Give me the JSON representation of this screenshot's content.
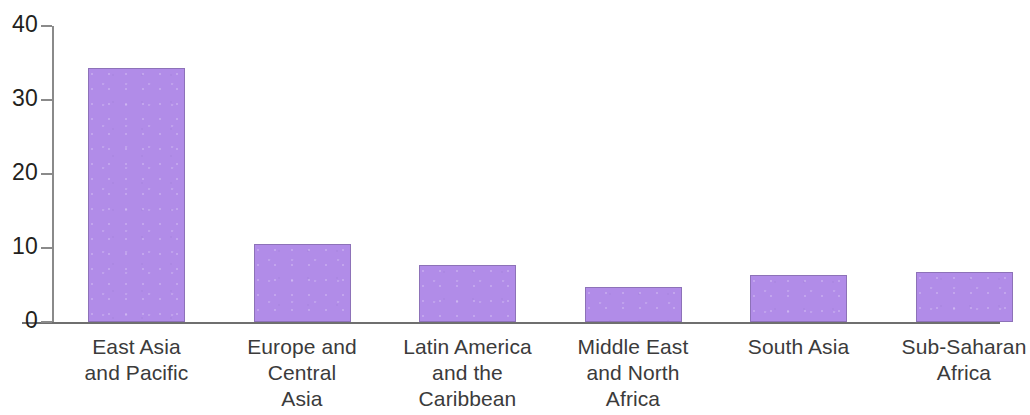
{
  "chart_data": {
    "type": "bar",
    "title": "",
    "subtitle": "",
    "xlabel": "",
    "ylabel": "",
    "categories": [
      "East Asia and Pacific",
      "Europe and Central Asia",
      "Latin America and the Caribbean",
      "Middle East and North Africa",
      "South Asia",
      "Sub-Saharan Africa"
    ],
    "category_lines": [
      [
        "East Asia",
        "and Pacific"
      ],
      [
        "Europe and",
        "Central",
        "Asia"
      ],
      [
        "Latin America",
        "and the",
        "Caribbean"
      ],
      [
        "Middle East",
        "and North",
        "Africa"
      ],
      [
        "South Asia"
      ],
      [
        "Sub-Saharan",
        "Africa"
      ]
    ],
    "values": [
      34.3,
      10.5,
      7.7,
      4.7,
      6.3,
      6.7
    ],
    "ylim": [
      0,
      40
    ],
    "yticks": [
      0,
      10,
      20,
      30,
      40
    ],
    "ytick_labels": [
      "0",
      "10",
      "20",
      "30",
      "40"
    ],
    "grid": false,
    "legend": null,
    "bar_color": "#b18ce8",
    "bar_border_color": "#8d72b8",
    "axis_color": "#6f6f6f",
    "label_color": "#3b3b3b",
    "background": "#ffffff"
  }
}
